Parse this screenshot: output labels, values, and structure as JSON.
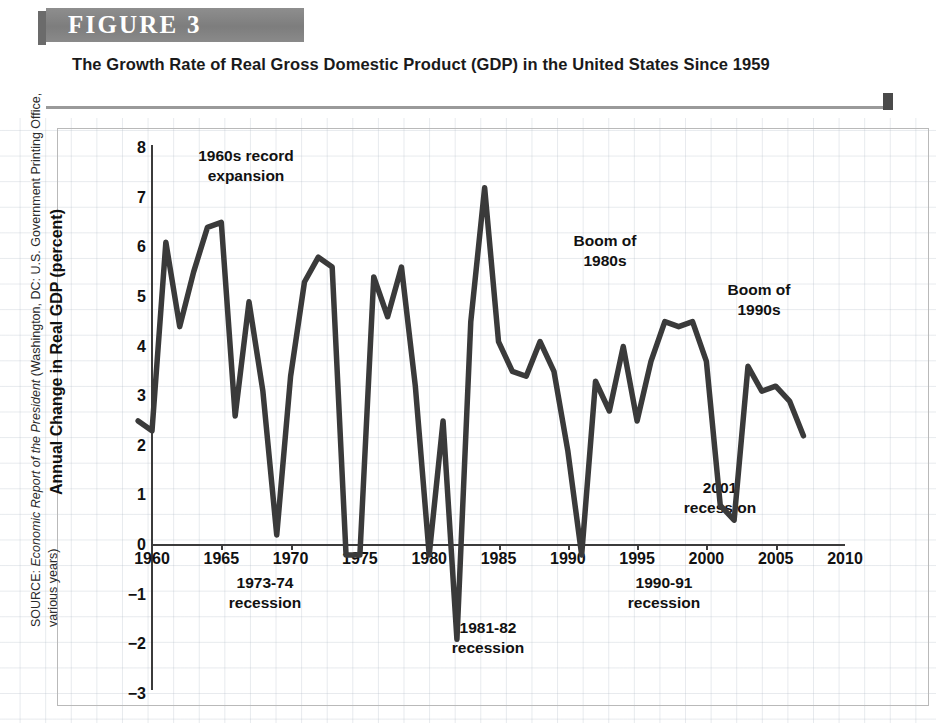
{
  "figure": {
    "banner_label": "FIGURE  3",
    "title": "The Growth Rate of Real Gross Domestic Product (GDP) in the United States Since 1959"
  },
  "source": {
    "prefix": "SOURCE: ",
    "italic_part": "Economic Report of the President",
    "suffix": " (Washington, DC: U.S. Government Printing Office, various years)"
  },
  "colors": {
    "banner": "#7d7d7d",
    "line": "#3a3a3a",
    "axis": "#3b3b3b",
    "grid": "#b0bac6",
    "text": "#111111"
  },
  "axis": {
    "y_title": "Annual Change in Real GDP (percent)",
    "y_ticks": [
      "8",
      "7",
      "6",
      "5",
      "4",
      "3",
      "2",
      "1",
      "0",
      "−1",
      "−2",
      "−3"
    ],
    "x_ticks": [
      "1960",
      "1965",
      "1970",
      "1975",
      "1980",
      "1985",
      "1990",
      "1995",
      "2000",
      "2005",
      "2010"
    ]
  },
  "annotations": [
    {
      "id": "expansion-1960s",
      "text": "1960s record\nexpansion",
      "x": 246,
      "y": 28
    },
    {
      "id": "recession-1973-74",
      "text": "1973-74\nrecession",
      "x": 265,
      "y": 455
    },
    {
      "id": "recession-1981-82",
      "text": "1981-82\nrecession",
      "x": 488,
      "y": 500
    },
    {
      "id": "boom-1980s",
      "text": "Boom of\n1980s",
      "x": 605,
      "y": 113
    },
    {
      "id": "recession-1990-91",
      "text": "1990-91\nrecession",
      "x": 664,
      "y": 455
    },
    {
      "id": "boom-1990s",
      "text": "Boom of\n1990s",
      "x": 759,
      "y": 162
    },
    {
      "id": "recession-2001",
      "text": "2001\nrecession",
      "x": 720,
      "y": 360
    }
  ],
  "chart_data": {
    "type": "line",
    "title": "The Growth Rate of Real Gross Domestic Product (GDP) in the United States Since 1959",
    "xlabel": "",
    "ylabel": "Annual Change in Real GDP (percent)",
    "xlim": [
      1959,
      2010
    ],
    "ylim": [
      -3,
      8
    ],
    "grid": true,
    "legend": "none",
    "x": [
      1959,
      1960,
      1961,
      1962,
      1963,
      1964,
      1965,
      1966,
      1967,
      1968,
      1969,
      1970,
      1971,
      1972,
      1973,
      1974,
      1975,
      1976,
      1977,
      1978,
      1979,
      1980,
      1981,
      1982,
      1983,
      1984,
      1985,
      1986,
      1987,
      1988,
      1989,
      1990,
      1991,
      1992,
      1993,
      1994,
      1995,
      1996,
      1997,
      1998,
      1999,
      2000,
      2001,
      2002,
      2003,
      2004,
      2005,
      2006,
      2007
    ],
    "values": [
      2.5,
      2.3,
      6.1,
      4.4,
      5.5,
      6.4,
      6.5,
      2.6,
      4.9,
      3.1,
      0.2,
      3.4,
      5.3,
      5.8,
      5.6,
      -0.2,
      -0.2,
      5.4,
      4.6,
      5.6,
      3.2,
      -0.2,
      2.5,
      -1.9,
      4.5,
      7.2,
      4.1,
      3.5,
      3.4,
      4.1,
      3.5,
      1.9,
      -0.2,
      3.3,
      2.7,
      4.0,
      2.5,
      3.7,
      4.5,
      4.4,
      4.5,
      3.7,
      0.8,
      0.5,
      3.6,
      3.1,
      3.2,
      2.9,
      2.2
    ]
  }
}
